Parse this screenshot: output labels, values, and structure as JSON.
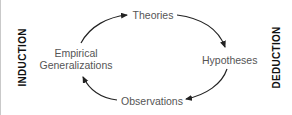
{
  "diagram": {
    "title": "",
    "side_labels": {
      "left": "INDUCTION",
      "right": "DEDUCTION"
    },
    "nodes": [
      {
        "id": "theories",
        "label": "Theories"
      },
      {
        "id": "hypotheses",
        "label": "Hypotheses"
      },
      {
        "id": "observations",
        "label": "Observations"
      },
      {
        "id": "empirical_generalizations",
        "label_line1": "Empirical",
        "label_line2": "Generalizations"
      }
    ],
    "edges": [
      {
        "from": "empirical_generalizations",
        "to": "theories"
      },
      {
        "from": "theories",
        "to": "hypotheses"
      },
      {
        "from": "hypotheses",
        "to": "observations"
      },
      {
        "from": "observations",
        "to": "empirical_generalizations"
      }
    ],
    "colors": {
      "node_text": "#555555",
      "side_text": "#111111",
      "arrow": "#222222",
      "border": "#c9c9c9"
    }
  }
}
